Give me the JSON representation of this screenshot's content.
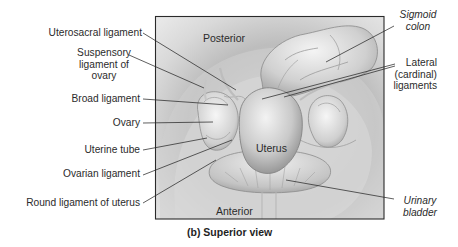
{
  "figure": {
    "caption": "(b) Superior view",
    "orientation": {
      "top": "Posterior",
      "bottom": "Anterior"
    },
    "center_label": "Uterus",
    "left_labels": [
      {
        "id": "uterosacral-ligament",
        "lines": [
          "Uterosacral ligament"
        ]
      },
      {
        "id": "suspensory-ligament-of-ovary",
        "lines": [
          "Suspensory",
          "ligament of",
          "ovary"
        ]
      },
      {
        "id": "broad-ligament",
        "lines": [
          "Broad ligament"
        ]
      },
      {
        "id": "ovary",
        "lines": [
          "Ovary"
        ]
      },
      {
        "id": "uterine-tube",
        "lines": [
          "Uterine tube"
        ]
      },
      {
        "id": "ovarian-ligament",
        "lines": [
          "Ovarian ligament"
        ]
      },
      {
        "id": "round-ligament-of-uterus",
        "lines": [
          "Round ligament of uterus"
        ]
      }
    ],
    "right_labels": [
      {
        "id": "sigmoid-colon",
        "lines": [
          "Sigmoid",
          "colon"
        ],
        "italic": true
      },
      {
        "id": "lateral-cardinal-ligaments",
        "lines": [
          "Lateral",
          "(cardinal)",
          "ligaments"
        ],
        "italic": false
      },
      {
        "id": "urinary-bladder",
        "lines": [
          "Urinary",
          "bladder"
        ],
        "italic": true
      }
    ],
    "colors": {
      "frame_border": "#2a2a2a",
      "background_light": "#e6e6e6",
      "background_dark": "#b9b9b9",
      "organ_light": "#f2f2f2",
      "organ_mid": "#c8c8c8",
      "organ_dark": "#8f8f8f",
      "leader_line": "#2a2a2a",
      "text": "#2b2b2b"
    }
  }
}
